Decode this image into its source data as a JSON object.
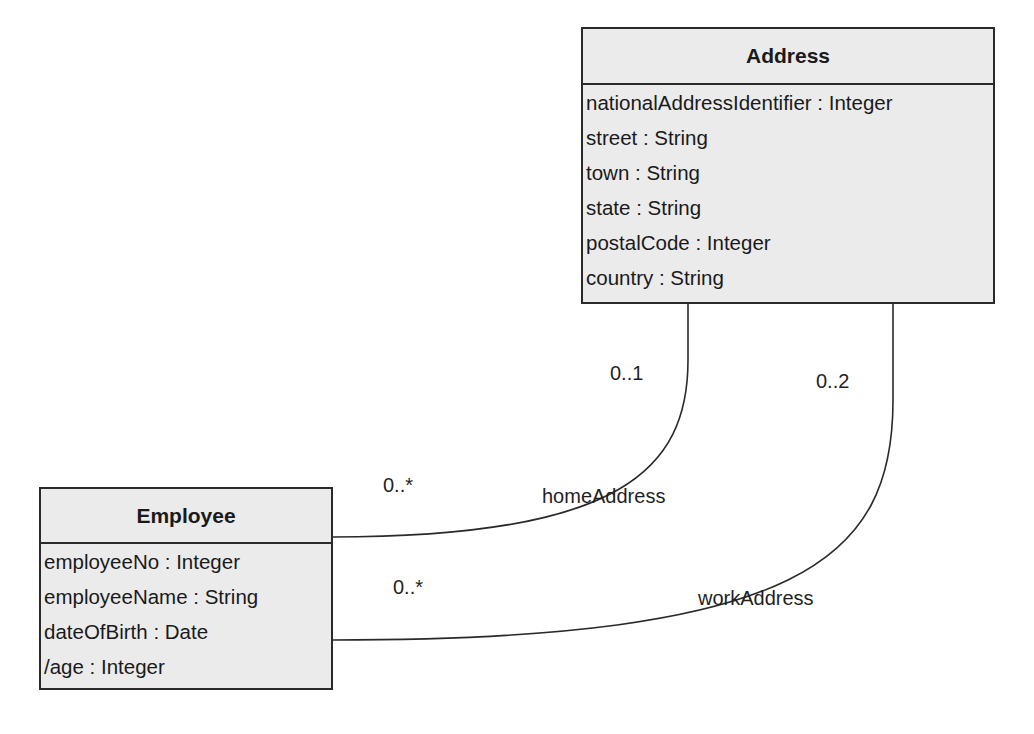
{
  "classes": {
    "address": {
      "name": "Address",
      "attributes": [
        "nationalAddressIdentifier : Integer",
        "street : String",
        "town : String",
        "state : String",
        "postalCode : Integer",
        "country : String"
      ]
    },
    "employee": {
      "name": "Employee",
      "attributes": [
        "employeeNo : Integer",
        "employeeName : String",
        "dateOfBirth : Date",
        "/age : Integer"
      ]
    }
  },
  "associations": {
    "home": {
      "role": "homeAddress",
      "address_multiplicity": "0..1",
      "employee_multiplicity": "0..*"
    },
    "work": {
      "role": "workAddress",
      "address_multiplicity": "0..2",
      "employee_multiplicity": "0..*"
    }
  },
  "colors": {
    "box_fill": "#ebebeb",
    "line": "#2a2a2a"
  }
}
